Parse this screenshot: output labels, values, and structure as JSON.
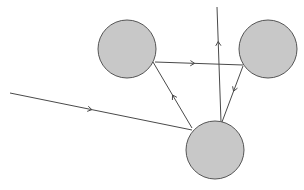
{
  "diagram": {
    "title": "",
    "style": {
      "node_fill": "#c8c8c8",
      "node_stroke": "#555555",
      "edge_stroke": "#4a4a4a",
      "background": "#ffffff"
    },
    "nodes": [
      {
        "id": "A",
        "label": "",
        "cx": 127,
        "cy": 49,
        "r": 29
      },
      {
        "id": "B",
        "label": "",
        "cx": 268,
        "cy": 49,
        "r": 29
      },
      {
        "id": "C",
        "label": "",
        "cx": 215,
        "cy": 150,
        "r": 29
      }
    ],
    "edges": [
      {
        "id": "incoming",
        "from": "external",
        "to": "C",
        "x1": 10,
        "y1": 93,
        "x2": 192,
        "y2": 130,
        "arrow_at": 0.45
      },
      {
        "id": "A-to-B",
        "from": "A",
        "to": "B",
        "x1": 155,
        "y1": 62,
        "x2": 243,
        "y2": 65,
        "arrow_at": 0.45
      },
      {
        "id": "B-to-C",
        "from": "B",
        "to": "C",
        "x1": 243,
        "y1": 66,
        "x2": 222,
        "y2": 122,
        "arrow_at": 0.45
      },
      {
        "id": "C-to-A",
        "from": "C",
        "to": "A",
        "x1": 192,
        "y1": 128,
        "x2": 153,
        "y2": 62,
        "arrow_at": 0.5
      },
      {
        "id": "outgoing",
        "from": "C",
        "to": "external",
        "x1": 221,
        "y1": 122,
        "x2": 217,
        "y2": 7,
        "arrow_at": 0.7
      }
    ]
  }
}
